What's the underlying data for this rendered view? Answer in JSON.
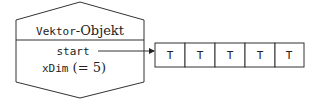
{
  "object": {
    "title_mono": "Vektor",
    "title_serif": "-Objekt",
    "fields": [
      {
        "name": "start",
        "suffix": ""
      },
      {
        "name": "xDim",
        "suffix": " (= 5)"
      }
    ]
  },
  "array": {
    "cells": [
      "T",
      "T",
      "T",
      "T",
      "T"
    ]
  },
  "colors": {
    "stroke": "#333333",
    "text": "#222222"
  }
}
